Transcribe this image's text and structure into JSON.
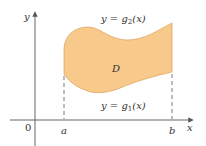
{
  "figure": {
    "region_label": "D",
    "upper_curve_label": {
      "prefix": "y = ",
      "func": "g",
      "sub": "2",
      "arg": "(x)"
    },
    "lower_curve_label": {
      "prefix": "y = ",
      "func": "g",
      "sub": "1",
      "arg": "(x)"
    },
    "x_axis_label": "x",
    "y_axis_label": "y",
    "origin_label": "0",
    "left_bound_label": "a",
    "right_bound_label": "b",
    "colors": {
      "region_fill": "#f7c98a",
      "region_stroke": "#d9964a",
      "axis": "#555555",
      "dashed": "#555555"
    }
  }
}
